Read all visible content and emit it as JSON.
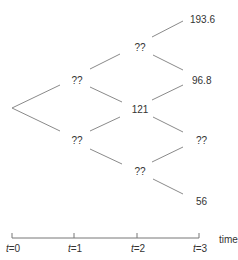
{
  "tree": {
    "root": {
      "label": "",
      "x": 12,
      "y": 108
    },
    "nodes": [
      {
        "id": "t1_up",
        "time": 1,
        "label": "??",
        "x": 77,
        "y": 84
      },
      {
        "id": "t1_down",
        "time": 1,
        "label": "??",
        "x": 77,
        "y": 144
      },
      {
        "id": "t2_uu",
        "time": 2,
        "label": "??",
        "x": 140,
        "y": 51
      },
      {
        "id": "t2_ud",
        "time": 2,
        "label": "121",
        "x": 140,
        "y": 113
      },
      {
        "id": "t2_dd",
        "time": 2,
        "label": "??",
        "x": 140,
        "y": 175
      },
      {
        "id": "t3_uuu",
        "time": 3,
        "label": "193.6",
        "x": 203,
        "y": 23
      },
      {
        "id": "t3_uud",
        "time": 3,
        "label": "96.8",
        "x": 203,
        "y": 84
      },
      {
        "id": "t3_udd",
        "time": 3,
        "label": "??",
        "x": 203,
        "y": 144
      },
      {
        "id": "t3_ddd",
        "time": 3,
        "label": "56",
        "x": 203,
        "y": 205
      }
    ]
  },
  "timeline": {
    "axis_label": "time",
    "ticks": [
      {
        "var": "t",
        "eq": "=",
        "value": "0"
      },
      {
        "var": "t",
        "eq": "=",
        "value": "1"
      },
      {
        "var": "t",
        "eq": "=",
        "value": "2"
      },
      {
        "var": "t",
        "eq": "=",
        "value": "3"
      }
    ]
  }
}
